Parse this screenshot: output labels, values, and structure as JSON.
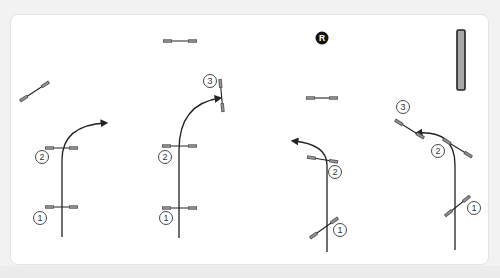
{
  "diagram": {
    "colors": {
      "background": "#f2f2f2",
      "frame": "#ffffff",
      "frame_border": "#e4e4e4",
      "line": "#222222",
      "pole_end": "#555555",
      "pole_end_fill": "#9a9a9a",
      "wall_fill": "#a8a8a8",
      "marker_fill": "#111111",
      "marker_text": "#ffffff"
    },
    "marker": {
      "label": "R",
      "x": 322,
      "y": 38
    },
    "wall": {
      "x": 461,
      "y1": 30,
      "y2": 90
    },
    "panels": [
      {
        "id": "panel-1",
        "path": "M62,237 L62,160 Q62,125 106,123",
        "arrow": {
          "x": 106,
          "y": 123,
          "dir": "right"
        },
        "jumps": [
          {
            "x1": 45,
            "y1": 207,
            "x2": 78,
            "y2": 207,
            "number": "1",
            "lx": 40,
            "ly": 218
          },
          {
            "x1": 45,
            "y1": 148,
            "x2": 78,
            "y2": 148,
            "number": "2",
            "lx": 42,
            "ly": 157
          }
        ]
      },
      {
        "id": "panel-2",
        "path": "M179,238 L179,150 Q179,104 220,98",
        "arrow": {
          "x": 220,
          "y": 98,
          "dir": "right-up"
        },
        "jumps": [
          {
            "x1": 162,
            "y1": 208,
            "x2": 197,
            "y2": 208,
            "number": "1",
            "lx": 166,
            "ly": 218
          },
          {
            "x1": 162,
            "y1": 146,
            "x2": 197,
            "y2": 146,
            "number": "2",
            "lx": 165,
            "ly": 157
          },
          {
            "x1": 220,
            "y1": 79,
            "x2": 223,
            "y2": 112,
            "number": "3",
            "lx": 210,
            "ly": 81
          }
        ]
      },
      {
        "id": "panel-3",
        "path": "M327,252 L327,165 Q327,144 293,141",
        "arrow": {
          "x": 293,
          "y": 141,
          "dir": "left"
        },
        "jumps": [
          {
            "x1": 310,
            "y1": 238,
            "x2": 338,
            "y2": 218,
            "number": "1",
            "lx": 340,
            "ly": 230
          },
          {
            "x1": 307,
            "y1": 157,
            "x2": 338,
            "y2": 162,
            "number": "2",
            "lx": 335,
            "ly": 172
          }
        ]
      },
      {
        "id": "panel-4",
        "path": "M455,250 L455,165 Q455,130 417,133",
        "arrow": {
          "x": 417,
          "y": 133,
          "dir": "left"
        },
        "jumps": [
          {
            "x1": 445,
            "y1": 216,
            "x2": 470,
            "y2": 196,
            "number": "1",
            "lx": 474,
            "ly": 208
          },
          {
            "x1": 443,
            "y1": 139,
            "x2": 472,
            "y2": 157,
            "number": "2",
            "lx": 438,
            "ly": 151
          },
          {
            "x1": 395,
            "y1": 120,
            "x2": 424,
            "y2": 138,
            "number": "3",
            "lx": 403,
            "ly": 107
          }
        ]
      }
    ],
    "loose_jumps": [
      {
        "x1": 20,
        "y1": 101,
        "x2": 49,
        "y2": 82
      },
      {
        "x1": 163,
        "y1": 41,
        "x2": 197,
        "y2": 41
      },
      {
        "x1": 306,
        "y1": 98,
        "x2": 338,
        "y2": 98
      }
    ]
  }
}
